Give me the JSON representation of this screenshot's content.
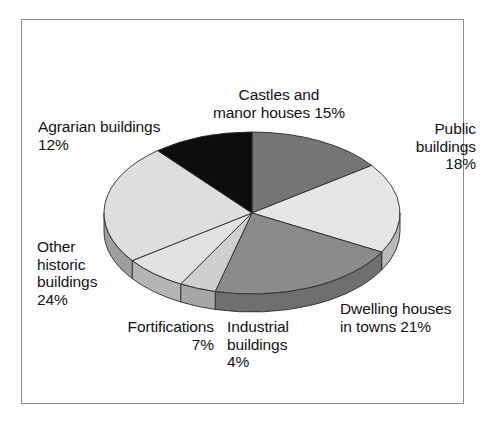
{
  "chart_data": {
    "type": "pie",
    "title": "",
    "subtitle": "",
    "xlabel": "",
    "ylabel": "",
    "legend_position": "none",
    "grid": false,
    "three_d": true,
    "start_angle_deg": 0,
    "direction": "clockwise",
    "unit": "%",
    "categories": [
      "Castles and manor houses",
      "Public buildings",
      "Dwelling houses in towns",
      "Industrial buildings",
      "Fortifications",
      "Other historic buildings",
      "Agrarian buildings"
    ],
    "values": [
      15,
      18,
      21,
      4,
      7,
      24,
      12
    ],
    "slices": [
      {
        "name": "Castles and manor houses",
        "value": 15,
        "label": "Castles and\nmanor houses 15%",
        "color": "#757575",
        "side_color": "#5e5e5e",
        "start_deg": 0,
        "end_deg": 54
      },
      {
        "name": "Public buildings",
        "value": 18,
        "label": "Public\nbuildings\n18%",
        "color": "#e6e6e6",
        "side_color": "#b9b9b9",
        "start_deg": 54,
        "end_deg": 118.8
      },
      {
        "name": "Dwelling houses in towns",
        "value": 21,
        "label": "Dwelling houses\nin towns 21%",
        "color": "#8b8b8b",
        "side_color": "#6f6f6f",
        "start_deg": 118.8,
        "end_deg": 194.4
      },
      {
        "name": "Industrial buildings",
        "value": 4,
        "label": "Industrial\nbuildings\n4%",
        "color": "#cfcfcf",
        "side_color": "#a6a6a6",
        "start_deg": 194.4,
        "end_deg": 208.8
      },
      {
        "name": "Fortifications",
        "value": 7,
        "label": "Fortifications\n7%",
        "color": "#e2e2e2",
        "side_color": "#b4b4b4",
        "start_deg": 208.8,
        "end_deg": 234
      },
      {
        "name": "Other historic buildings",
        "value": 24,
        "label": "Other\nhistoric\nbuildings\n24%",
        "color": "#dedede",
        "side_color": "#9e9e9e",
        "start_deg": 234,
        "end_deg": 320.4
      },
      {
        "name": "Agrarian buildings",
        "value": 12,
        "label": "Agrarian buildings\n12%",
        "color": "#0d0d0d",
        "side_color": "#0d0d0d",
        "start_deg": 320.4,
        "end_deg": 360
      }
    ]
  },
  "labels": {
    "castles": "Castles and\nmanor houses 15%",
    "public": "Public\nbuildings\n18%",
    "dwelling": "Dwelling houses\nin towns 21%",
    "industrial": "Industrial\nbuildings\n4%",
    "fortifications": "Fortifications\n7%",
    "other_historic": "Other\nhistoric\nbuildings\n24%",
    "agrarian": "Agrarian buildings\n12%"
  },
  "style": {
    "frame_color": "#8e8e8e",
    "background": "#ffffff",
    "text_color": "#141414"
  }
}
